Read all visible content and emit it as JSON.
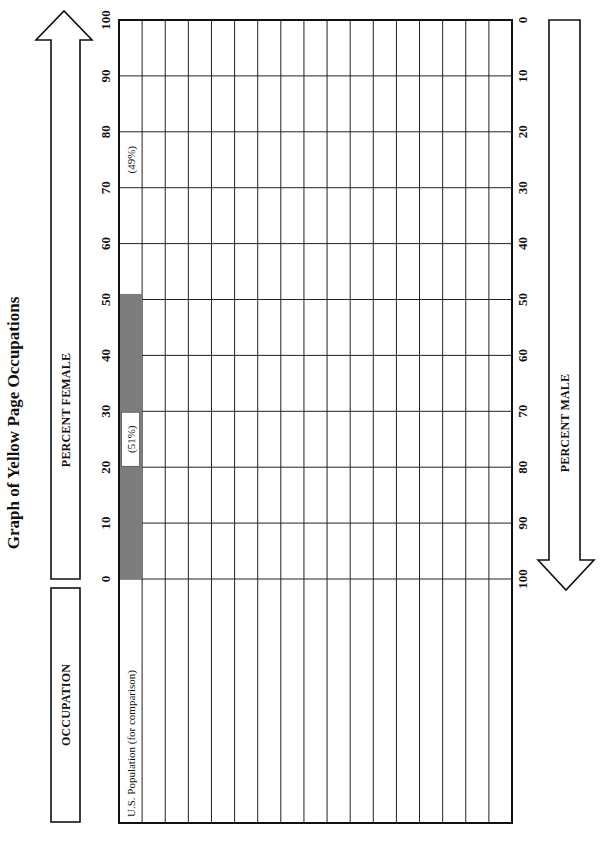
{
  "title": "Graph of Yellow Page Occupations",
  "labels": {
    "occupation": "OCCUPATION",
    "percent_female": "PERCENT FEMALE",
    "percent_male": "PERCENT MALE"
  },
  "colors": {
    "bar": "#7d7d7d",
    "ink": "#111111",
    "paper": "#ffffff"
  },
  "chart_data": {
    "type": "bar",
    "orientation": "horizontal (page rotated 90°)",
    "title": "Graph of Yellow Page Occupations",
    "xlabel": "OCCUPATION",
    "ylabel": "PERCENT FEMALE",
    "secondary_ylabel": "PERCENT MALE",
    "female_ticks": [
      0,
      10,
      20,
      30,
      40,
      50,
      60,
      70,
      80,
      90,
      100
    ],
    "male_ticks": [
      100,
      90,
      80,
      70,
      60,
      50,
      40,
      30,
      20,
      10,
      0
    ],
    "ylim": [
      0,
      100
    ],
    "grid": true,
    "row_count": 17,
    "categories": [
      "U.S. Population (for comparison)",
      "",
      "",
      "",
      "",
      "",
      "",
      "",
      "",
      "",
      "",
      "",
      "",
      "",
      "",
      "",
      ""
    ],
    "series": [
      {
        "name": "Percent Female",
        "values": [
          51,
          null,
          null,
          null,
          null,
          null,
          null,
          null,
          null,
          null,
          null,
          null,
          null,
          null,
          null,
          null,
          null
        ]
      }
    ],
    "annotations": [
      {
        "row": 0,
        "text": "(51%)",
        "at_female": 25,
        "meaning": "female share"
      },
      {
        "row": 0,
        "text": "(49%)",
        "at_female": 75,
        "meaning": "male share"
      }
    ]
  }
}
